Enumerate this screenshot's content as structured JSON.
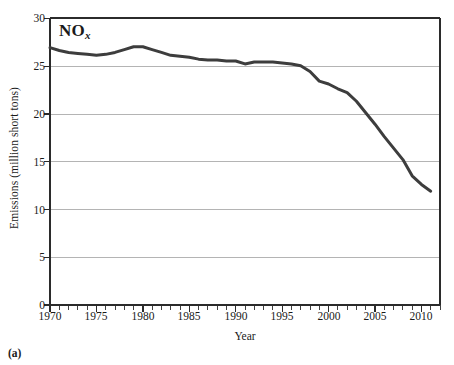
{
  "figure": {
    "caption": "(a)",
    "series_label_main": "NO",
    "series_label_sub": "x"
  },
  "chart_data": {
    "type": "line",
    "title": "",
    "xlabel": "Year",
    "ylabel": "Emissions (million short tons)",
    "xlim": [
      1970,
      2012
    ],
    "ylim": [
      0,
      30
    ],
    "ytick_values": [
      0,
      5,
      10,
      15,
      20,
      25,
      30
    ],
    "ytick_labels": [
      "0",
      "5",
      "10",
      "15",
      "20",
      "25",
      "30"
    ],
    "xtick_values": [
      1970,
      1975,
      1980,
      1985,
      1990,
      1995,
      2000,
      2005,
      2010
    ],
    "xtick_labels": [
      "1970",
      "1975",
      "1980",
      "1985",
      "1990",
      "1995",
      "2000",
      "2005",
      "2010"
    ],
    "x_minor_tick_interval": 1,
    "grid": "horizontal",
    "legend": "none",
    "series": [
      {
        "name": "NOx",
        "color": "#3d3d3d",
        "line_width": 3,
        "x": [
          1970,
          1971,
          1972,
          1973,
          1974,
          1975,
          1976,
          1977,
          1978,
          1979,
          1980,
          1981,
          1982,
          1983,
          1984,
          1985,
          1986,
          1987,
          1988,
          1989,
          1990,
          1991,
          1992,
          1993,
          1994,
          1995,
          1996,
          1997,
          1998,
          1999,
          2000,
          2001,
          2002,
          2003,
          2004,
          2005,
          2006,
          2007,
          2008,
          2009,
          2010,
          2011
        ],
        "values": [
          26.9,
          26.6,
          26.4,
          26.3,
          26.2,
          26.1,
          26.2,
          26.4,
          26.7,
          27.0,
          27.0,
          26.7,
          26.4,
          26.1,
          26.0,
          25.9,
          25.7,
          25.6,
          25.6,
          25.5,
          25.5,
          25.2,
          25.4,
          25.4,
          25.4,
          25.3,
          25.2,
          25.0,
          24.4,
          23.4,
          23.1,
          22.6,
          22.2,
          21.3,
          20.1,
          18.9,
          17.6,
          16.4,
          15.2,
          13.5,
          12.6,
          11.9
        ]
      }
    ]
  }
}
